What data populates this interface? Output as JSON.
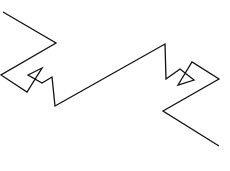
{
  "diagram": {
    "type": "line-drawing",
    "background": "#ffffff",
    "stroke_color": "#111111",
    "stroke_width": 1.3,
    "polyline_points": [
      [
        3,
        12
      ],
      [
        56,
        43
      ],
      [
        1,
        75
      ],
      [
        27,
        92
      ],
      [
        42,
        68
      ],
      [
        28,
        75
      ],
      [
        42,
        83
      ],
      [
        52,
        77
      ],
      [
        55,
        106
      ],
      [
        165,
        44
      ],
      [
        166,
        79
      ],
      [
        180,
        69
      ],
      [
        194,
        80
      ],
      [
        178,
        85
      ],
      [
        192,
        62
      ],
      [
        219,
        79
      ],
      [
        163,
        111
      ],
      [
        219,
        146
      ]
    ]
  }
}
